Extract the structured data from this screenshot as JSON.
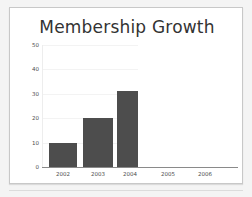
{
  "chart_data": {
    "type": "bar",
    "title": "Membership Growth",
    "xlabel": "",
    "ylabel": "",
    "categories": [
      "2002",
      "2003",
      "2004",
      "2005",
      "2006"
    ],
    "values": [
      10,
      20,
      31,
      0,
      0
    ],
    "ylim": [
      0,
      50
    ],
    "yticks": [
      0,
      10,
      20,
      30,
      40,
      50
    ],
    "ytick_labels": [
      "0",
      "10",
      "20",
      "30",
      "40",
      "50"
    ],
    "grid": true,
    "grid_axis": "y",
    "legend": false,
    "legend_position": "none",
    "series": [
      {
        "name": "Members",
        "values": [
          10,
          20,
          31,
          0,
          0
        ]
      }
    ]
  },
  "colors": {
    "bar": "#4d4d4d",
    "panel_background": "#ffffff",
    "panel_border": "#c8c8c8",
    "slide_background": "#f4f4f4",
    "gridline": "#f3f3f3",
    "axis_line": "#8a8a8a",
    "title_text": "#333333",
    "tick_text": "#4c4c4c"
  }
}
